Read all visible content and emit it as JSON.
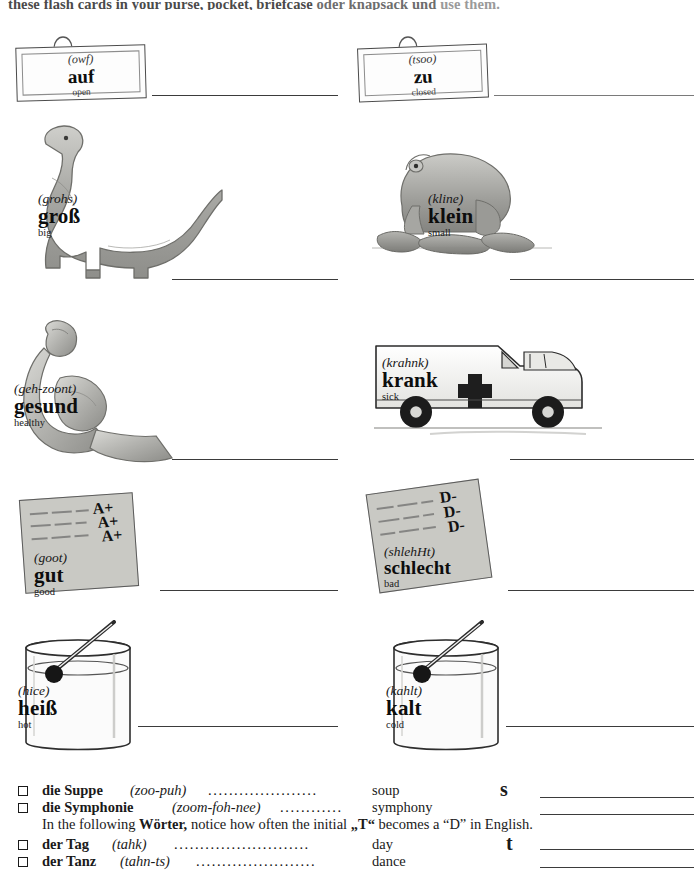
{
  "page": {
    "instruction_line": {
      "part1": "these flash cards in your purse, pocket, briefcase ",
      "oder": "oder",
      "part2": " knapsack ",
      "und": "und",
      "part3": " use them."
    }
  },
  "vocab_pairs": [
    {
      "id": "auf-zu",
      "left": {
        "pron": "(owf)",
        "word": "auf",
        "english": "open",
        "art": "hanging-sign"
      },
      "right": {
        "pron": "(tsoo)",
        "word": "zu",
        "english": "closed",
        "art": "hanging-sign"
      }
    },
    {
      "id": "gross-klein",
      "left": {
        "pron": "(grohs)",
        "word": "groß",
        "english": "big",
        "art": "dinosaur"
      },
      "right": {
        "pron": "(kline)",
        "word": "klein",
        "english": "small",
        "art": "frog"
      }
    },
    {
      "id": "gesund-krank",
      "left": {
        "pron": "(geh-zoont)",
        "word": "gesund",
        "english": "healthy",
        "art": "flexing-arm"
      },
      "right": {
        "pron": "(krahnk)",
        "word": "krank",
        "english": "sick",
        "art": "ambulance"
      }
    },
    {
      "id": "gut-schlecht",
      "left": {
        "pron": "(goot)",
        "word": "gut",
        "english": "good",
        "art": "report-card",
        "grades": [
          "A+",
          "A+",
          "A+"
        ]
      },
      "right": {
        "pron": "(shlehHt)",
        "word": "schlecht",
        "english": "bad",
        "art": "report-card",
        "grades": [
          "D-",
          "D-",
          "D-"
        ]
      }
    },
    {
      "id": "heiss-kalt",
      "left": {
        "pron": "(hice)",
        "word": "heiß",
        "english": "hot",
        "art": "beaker-thermometer"
      },
      "right": {
        "pron": "(kahlt)",
        "word": "kalt",
        "english": "cold",
        "art": "beaker-thermometer"
      }
    }
  ],
  "vocab_list": {
    "dots": "..........................",
    "rows": [
      {
        "german": "die Suppe",
        "pron": "(zoo-puh)",
        "dots": ".....................",
        "english": "soup",
        "hint": "s"
      },
      {
        "german": "die Symphonie",
        "pron": "(zoom-foh-nee)",
        "dots": "............",
        "english": "symphony",
        "hint": ""
      }
    ],
    "note": {
      "before": "In the following ",
      "bold1": "Wörter,",
      "middle": " notice how often the initial ",
      "quoted": "„T“",
      "after": " becomes a “D” in English."
    },
    "rows2": [
      {
        "german": "der Tag",
        "pron": "(tahk)",
        "dots": "..........................",
        "english": "day",
        "hint": "t"
      },
      {
        "german": "der Tanz",
        "pron": "(tahn-ts)",
        "dots": ".......................",
        "english": "dance",
        "hint": ""
      }
    ]
  },
  "colors": {
    "ink": "#1a1a1a",
    "rule": "#3b3b3b",
    "card_paper": "#c9c9c4",
    "art_grey": "#9a9a98"
  }
}
